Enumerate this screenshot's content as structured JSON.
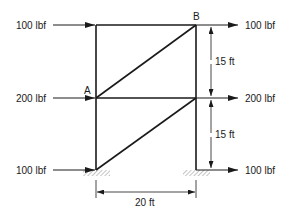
{
  "diagram": {
    "type": "truss",
    "nodes": {
      "A": "A",
      "B": "B"
    },
    "loads": {
      "left_top": "100 lbf",
      "left_middle": "200 lbf",
      "left_bottom": "100 lbf",
      "right_top": "100 lbf",
      "right_middle": "200 lbf",
      "right_bottom": "100 lbf"
    },
    "dimensions": {
      "upper_height": "15 ft",
      "lower_height": "15 ft",
      "width": "20 ft"
    },
    "colors": {
      "line": "#1a1a1a",
      "support_hatch": "#9a9a9a"
    }
  }
}
